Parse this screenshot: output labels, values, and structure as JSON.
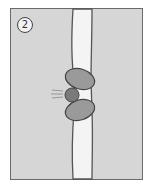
{
  "figure": {
    "step_label": "2",
    "colors": {
      "background": "#d6d6d6",
      "membrane": "#f4f4f4",
      "membrane_edge": "#555555",
      "protein": "#9a9a9a",
      "molecule": "#7a7a7a"
    },
    "elements": [
      "cell-membrane",
      "channel-protein-top",
      "channel-protein-bottom",
      "molecule",
      "motion-lines"
    ]
  }
}
